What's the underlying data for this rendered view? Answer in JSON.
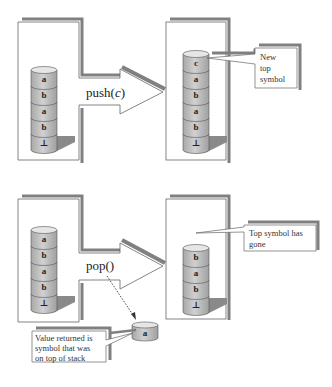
{
  "diagram": {
    "colors": {
      "shadow": "#808080",
      "cylinder_fill": "#bdbdbd",
      "cylinder_top": "#e6e6e6",
      "outline": "#555555"
    },
    "push": {
      "operation": "push(",
      "operation_arg": "c",
      "operation_close": ")",
      "before_stack": [
        "a",
        "b",
        "a",
        "b",
        "⊥"
      ],
      "after_stack": [
        "c",
        "a",
        "b",
        "a",
        "b",
        "⊥"
      ],
      "callout": [
        "New",
        "top",
        "symbol"
      ]
    },
    "pop": {
      "operation": "pop()",
      "before_stack": [
        "a",
        "b",
        "a",
        "b",
        "⊥"
      ],
      "after_stack": [
        "b",
        "a",
        "b",
        "⊥"
      ],
      "callout": [
        "Top symbol has",
        "gone"
      ],
      "returned_value": "a",
      "returned_callout": [
        "Value returned is",
        "symbol that was",
        "on top of stack"
      ]
    }
  }
}
